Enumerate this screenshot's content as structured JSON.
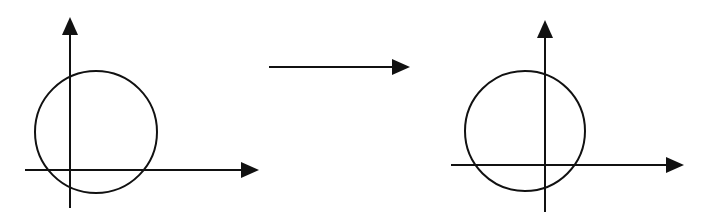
{
  "diagram": {
    "stroke_color": "#111111",
    "background": "#ffffff",
    "panels": [
      {
        "id": "before",
        "y_axis": {
          "x": 70,
          "y_top": 17,
          "y_bottom": 208
        },
        "x_axis": {
          "y": 170,
          "x_left": 25,
          "x_right": 259
        },
        "circle": {
          "cx": 96,
          "cy": 132,
          "r": 61
        }
      },
      {
        "id": "after",
        "y_axis": {
          "x": 545,
          "y_top": 20,
          "y_bottom": 212
        },
        "x_axis": {
          "y": 165,
          "x_left": 451,
          "x_right": 684
        },
        "circle": {
          "cx": 525,
          "cy": 131,
          "r": 60
        }
      }
    ],
    "transition_arrow": {
      "x1": 269,
      "x2": 410,
      "y": 67
    }
  }
}
